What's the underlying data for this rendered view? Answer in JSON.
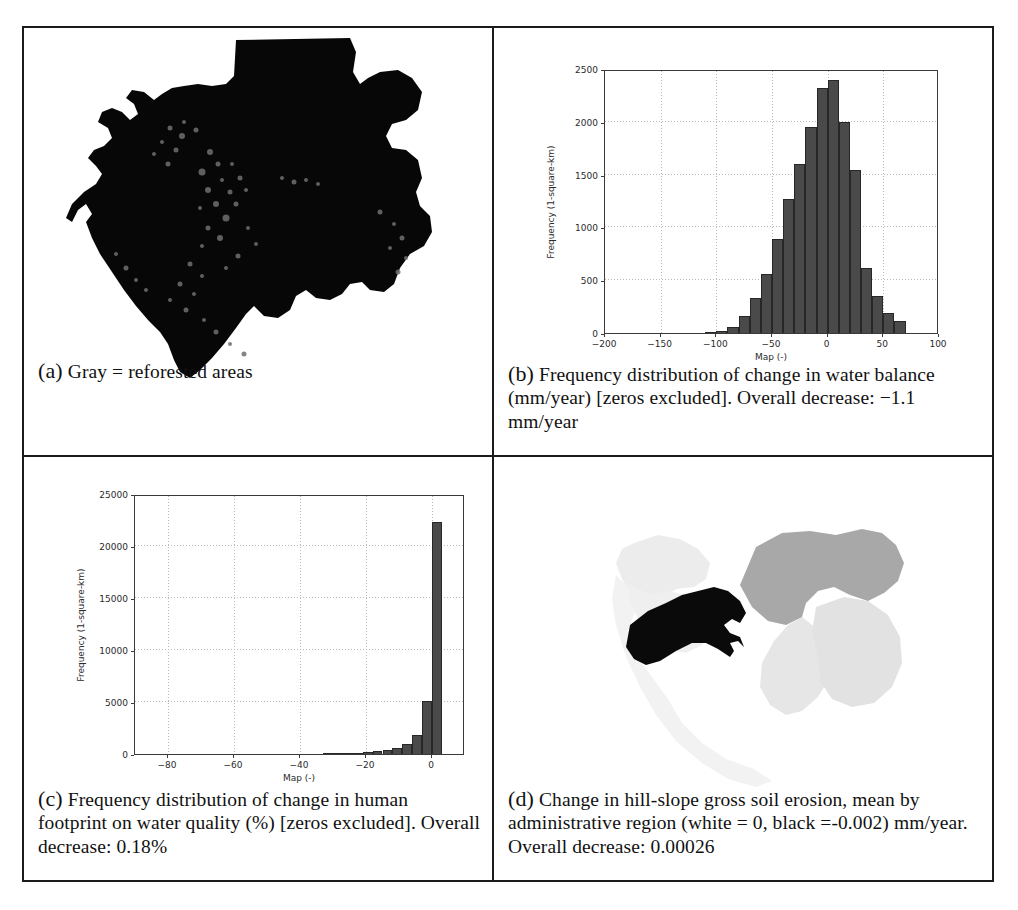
{
  "figure": {
    "panels": [
      {
        "id": "a",
        "tag": "(a)",
        "caption": "Gray = reforested areas"
      },
      {
        "id": "b",
        "tag": "(b)",
        "caption": "Frequency distribution of change in water balance (mm/year) [zeros excluded]. Overall decrease: −1.1 mm/year"
      },
      {
        "id": "c",
        "tag": "(c)",
        "caption": "Frequency distribution of change in human footprint on water quality (%) [zeros excluded]. Overall decrease: 0.18%"
      },
      {
        "id": "d",
        "tag": "(d)",
        "caption": "Change in hill-slope gross soil erosion, mean by administrative region (white = 0, black =-0.002) mm/year. Overall decrease: 0.00026"
      }
    ]
  },
  "maps": {
    "panel_a": {
      "name": "reforested-areas-map",
      "country": "Gabon",
      "fill_color": "#070707",
      "legend_note": "Gray = reforested areas"
    },
    "panel_d": {
      "name": "soil-erosion-by-region-map",
      "country": "Gabon",
      "scale_white": "0",
      "scale_black": "-0.002",
      "units": "mm/year",
      "region_shades": [
        "#0a0a0a",
        "#a8a8a8",
        "#dcdcdc",
        "#ececec",
        "#f2f2f2"
      ]
    }
  },
  "chart_data": [
    {
      "id": "b",
      "type": "bar",
      "title": "",
      "xlabel": "Map (-)",
      "ylabel": "Frequency (1-square-km)",
      "xlim": [
        -200,
        100
      ],
      "ylim": [
        0,
        2500
      ],
      "xticks": [
        -200,
        -150,
        -100,
        -50,
        0,
        50,
        100
      ],
      "yticks": [
        0,
        500,
        1000,
        1500,
        2000,
        2500
      ],
      "grid": true,
      "bin_width": 10,
      "bin_left_edges": [
        -110,
        -100,
        -90,
        -80,
        -70,
        -60,
        -50,
        -40,
        -30,
        -20,
        -10,
        0,
        10,
        20,
        30,
        40,
        50,
        60
      ],
      "values": [
        10,
        20,
        60,
        160,
        330,
        560,
        890,
        1270,
        1600,
        1950,
        2320,
        2400,
        2000,
        1540,
        620,
        350,
        185,
        110
      ],
      "bar_color": "#4a4a4a"
    },
    {
      "id": "c",
      "type": "bar",
      "title": "",
      "xlabel": "Map (-)",
      "ylabel": "Frequency (1-square-km)",
      "xlim": [
        -90,
        10
      ],
      "ylim": [
        0,
        25000
      ],
      "xticks": [
        -80,
        -60,
        -40,
        -20,
        0
      ],
      "yticks": [
        0,
        5000,
        10000,
        15000,
        20000,
        25000
      ],
      "grid": true,
      "bin_width": 3,
      "bin_left_edges": [
        -33,
        -30,
        -27,
        -24,
        -21,
        -18,
        -15,
        -12,
        -9,
        -6,
        -3,
        0
      ],
      "values": [
        40,
        60,
        90,
        120,
        170,
        250,
        380,
        600,
        980,
        1850,
        5100,
        22300
      ],
      "bar_color": "#4a4a4a"
    }
  ]
}
